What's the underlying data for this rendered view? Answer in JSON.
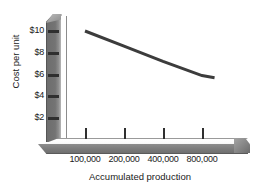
{
  "chart_data": {
    "type": "line",
    "title": "",
    "xlabel": "Accumulated production",
    "ylabel": "Cost per unit",
    "x_tick_labels": [
      "100,000",
      "200,000",
      "400,000",
      "800,000"
    ],
    "x_tick_values": [
      100000,
      200000,
      400000,
      800000
    ],
    "x_scale": "log2",
    "y_tick_labels": [
      "$10",
      "$8",
      "$6",
      "$4",
      "$2"
    ],
    "y_tick_values": [
      10,
      8,
      6,
      4,
      2
    ],
    "ylim": [
      0,
      11
    ],
    "grid": false,
    "legend": null,
    "series": [
      {
        "name": "Unit cost",
        "x": [
          100000,
          200000,
          400000,
          800000,
          1000000
        ],
        "values": [
          10.0,
          8.6,
          7.2,
          5.9,
          5.7
        ],
        "color": "#3c3c3c",
        "line_width": 3
      }
    ],
    "annotations": []
  },
  "axes": {
    "y_label": "Cost per unit",
    "x_label": "Accumulated production",
    "y_ticks": [
      {
        "label": "$10",
        "value": 10
      },
      {
        "label": "$8",
        "value": 8
      },
      {
        "label": "$6",
        "value": 6
      },
      {
        "label": "$4",
        "value": 4
      },
      {
        "label": "$2",
        "value": 2
      }
    ],
    "x_ticks": [
      {
        "label": "100,000",
        "value": 100000
      },
      {
        "label": "200,000",
        "value": 200000
      },
      {
        "label": "400,000",
        "value": 400000
      },
      {
        "label": "800,000",
        "value": 800000
      }
    ]
  },
  "style": {
    "axis_bar_color": "#6f6f6f",
    "axis_top_face_color": "#ffffff",
    "line_color": "#3c3c3c",
    "text_color": "#1a1a1a",
    "background": "#ffffff"
  }
}
